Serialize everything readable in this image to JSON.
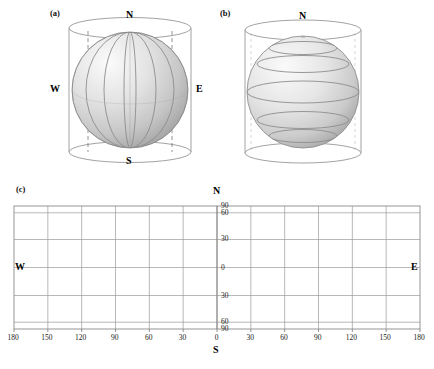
{
  "figure": {
    "background": "#ffffff",
    "line_color": "#6b6b6b",
    "grid_color": "#8f8f8f",
    "sphere_light": "#f2f2f2",
    "sphere_dark": "#9e9e9e"
  },
  "panels": {
    "a": {
      "label": "(a)",
      "caption_kind": "sphere-with-meridians-in-cylinder",
      "compass": {
        "north": "N",
        "south": "S",
        "west": "W",
        "east": "E"
      }
    },
    "b": {
      "label": "(b)",
      "caption_kind": "sphere-with-parallels-in-cylinder",
      "compass": {
        "north": "N"
      }
    },
    "c": {
      "label": "(c)",
      "caption_kind": "cylindrical-projection-graticule",
      "compass": {
        "north": "N",
        "south": "S",
        "west": "W",
        "east": "E"
      }
    }
  },
  "chart_data": {
    "type": "grid",
    "title": "",
    "xlabel": "",
    "ylabel": "",
    "xlim": [
      -180,
      180
    ],
    "ylim": [
      -90,
      90
    ],
    "grid": true,
    "legend": "none",
    "x_ticks": [
      -180,
      -150,
      -120,
      -90,
      -60,
      -30,
      0,
      30,
      60,
      90,
      120,
      150,
      180
    ],
    "x_tick_labels": [
      "180",
      "150",
      "120",
      "90",
      "60",
      "30",
      "0",
      "30",
      "60",
      "90",
      "120",
      "150",
      "180"
    ],
    "y_ticks": [
      90,
      60,
      30,
      0,
      -30,
      -60,
      -90
    ],
    "y_tick_labels": [
      "90",
      "60",
      "30",
      "0",
      "30",
      "60",
      "90"
    ],
    "y_tick_pixel_fraction": [
      0.0,
      0.055,
      0.272,
      0.5,
      0.728,
      0.945,
      1.0
    ]
  }
}
